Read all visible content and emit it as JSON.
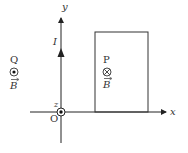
{
  "diagram": {
    "axes": {
      "x_label": "x",
      "y_label": "y",
      "z_label": "z",
      "origin_label": "O"
    },
    "current": {
      "label": "I",
      "direction": "+y"
    },
    "point_p": {
      "label": "P",
      "field_symbol": "⊗",
      "field_direction": "into-page",
      "field_label": "B"
    },
    "point_q": {
      "label": "Q",
      "field_symbol": "⊙",
      "field_direction": "out-of-page",
      "field_label": "B"
    },
    "loop": {
      "shape": "rectangle",
      "color": "#333333"
    },
    "colors": {
      "line": "#222222",
      "text": "#333333",
      "background": "#ffffff"
    }
  }
}
